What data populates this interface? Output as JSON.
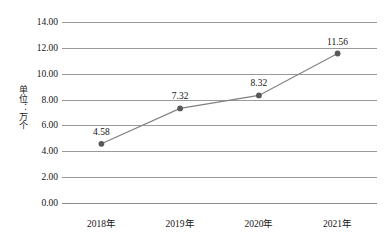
{
  "chart_data": {
    "type": "line",
    "title": "",
    "xlabel": "",
    "ylabel": "单位：万个",
    "categories": [
      "2018年",
      "2019年",
      "2020年",
      "2021年"
    ],
    "values": [
      4.58,
      7.32,
      8.32,
      11.56
    ],
    "point_labels": [
      "4.58",
      "7.32",
      "8.32",
      "11.56"
    ],
    "series": [
      {
        "name": "",
        "values": [
          4.58,
          7.32,
          8.32,
          11.56
        ]
      }
    ],
    "ylim": [
      0,
      14
    ],
    "ytick_step": 2,
    "ytick_labels": [
      "14.00",
      "12.00",
      "10.00",
      "8.00",
      "6.00",
      "4.00",
      "2.00",
      "0.00"
    ],
    "ytick_values": [
      14,
      12,
      10,
      8,
      6,
      4,
      2,
      0
    ],
    "grid": true,
    "grid_orientation": "horizontal",
    "legend": "none",
    "marker": "circle",
    "colors": {
      "line": "#808080",
      "marker": "#595959",
      "grid": "#9a9a9a",
      "axis": "#8c8c8c",
      "text": "#161616",
      "background": "#ffffff"
    }
  }
}
